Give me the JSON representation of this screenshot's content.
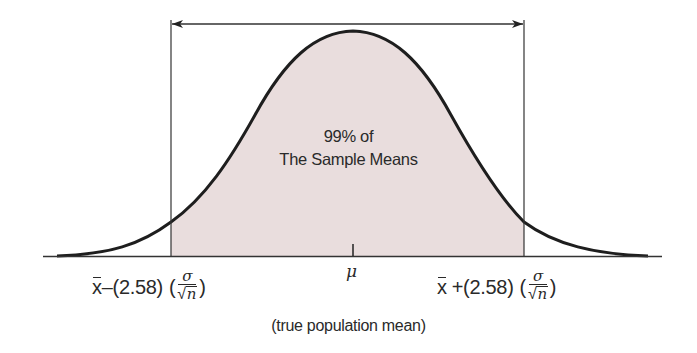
{
  "diagram": {
    "type": "normal-distribution-confidence-interval",
    "shaded_region_label_line1": "99% of",
    "shaded_region_label_line2": "The Sample Means",
    "center_symbol": "μ",
    "center_caption": "(true population mean)",
    "lower_bound": {
      "xbar": "x",
      "operator": "–",
      "z_value": "(2.58)",
      "open_paren": "(",
      "numerator": "σ",
      "radical": "√",
      "denominator": "n",
      "close_paren": ")"
    },
    "upper_bound": {
      "xbar": "x",
      "operator": "+",
      "z_value": "(2.58)",
      "open_paren": "(",
      "numerator": "σ",
      "radical": "√",
      "denominator": "n",
      "close_paren": ")"
    },
    "colors": {
      "shade": "#e8dcdc",
      "curve": "#1e1e1e",
      "lines": "#333333"
    }
  }
}
